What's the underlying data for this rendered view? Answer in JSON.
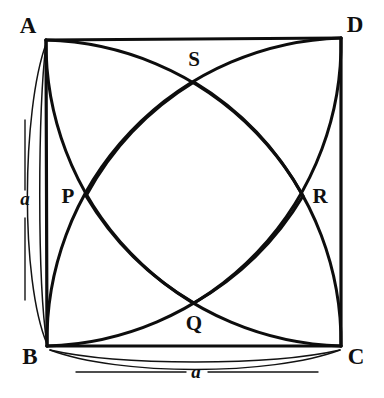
{
  "figure": {
    "type": "geometry-diagram",
    "canvas": {
      "width": 384,
      "height": 398,
      "background": "#ffffff"
    },
    "ink_color": "#0d0d0d",
    "square": {
      "name": "ABCD",
      "side_length_symbol": "a",
      "vertices": [
        {
          "id": "A",
          "label": "A",
          "x": 46,
          "y": 40,
          "label_x": 28,
          "label_y": 33
        },
        {
          "id": "D",
          "label": "D",
          "x": 341,
          "y": 38,
          "label_x": 355,
          "label_y": 32
        },
        {
          "id": "C",
          "label": "C",
          "x": 341,
          "y": 346,
          "label_x": 356,
          "label_y": 364
        },
        {
          "id": "B",
          "label": "B",
          "x": 47,
          "y": 346,
          "label_x": 30,
          "label_y": 364
        }
      ]
    },
    "arcs": [
      {
        "id": "arc-from-A",
        "center": "A",
        "radius_symbol": "a",
        "from": "B",
        "to": "D"
      },
      {
        "id": "arc-from-B",
        "center": "B",
        "radius_symbol": "a",
        "from": "A",
        "to": "C"
      },
      {
        "id": "arc-from-C",
        "center": "C",
        "radius_symbol": "a",
        "from": "B",
        "to": "D"
      },
      {
        "id": "arc-from-D",
        "center": "D",
        "radius_symbol": "a",
        "from": "A",
        "to": "C"
      }
    ],
    "intersection_points": [
      {
        "id": "S",
        "label": "S",
        "x": 194,
        "y": 82,
        "label_x": 194,
        "label_y": 66
      },
      {
        "id": "P",
        "label": "P",
        "x": 86,
        "y": 196,
        "label_x": 68,
        "label_y": 203
      },
      {
        "id": "R",
        "label": "R",
        "x": 303,
        "y": 196,
        "label_x": 320,
        "label_y": 203
      },
      {
        "id": "Q",
        "label": "Q",
        "x": 194,
        "y": 303,
        "label_x": 194,
        "label_y": 330
      }
    ],
    "shaded_region": {
      "name": "PQRS",
      "vertices": [
        "P",
        "S",
        "R",
        "Q"
      ],
      "fill_style": "diagonal-hatch",
      "hatch_direction": "bottom-left-to-top-right",
      "hatch_spacing_px": 4,
      "hatch_angle_deg": 45,
      "hatch_color": "#0d0d0d"
    },
    "dimensions": [
      {
        "id": "dim-left",
        "label": "a",
        "side": "AB",
        "orientation": "vertical",
        "label_x": 25,
        "label_y": 205
      },
      {
        "id": "dim-bottom",
        "label": "a",
        "side": "BC",
        "orientation": "horizontal",
        "label_x": 196,
        "label_y": 378
      }
    ]
  }
}
